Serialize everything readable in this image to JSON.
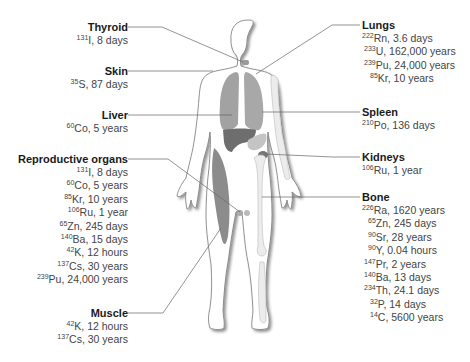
{
  "figure": {
    "colors": {
      "organ_dark": "#6e6e6e",
      "organ_mid": "#9a9a9a",
      "organ_light": "#c4c4c4",
      "bone": "#eeeeee",
      "outline": "#777777",
      "leader": "#666666",
      "title_text": "#1a1a1a",
      "item_text": "#444444"
    }
  },
  "left_labels": [
    {
      "name": "Thyroid",
      "items": [
        {
          "mass": "131",
          "text": "I, 8 days"
        }
      ]
    },
    {
      "name": "Skin",
      "items": [
        {
          "mass": "35",
          "text": "S, 87 days"
        }
      ]
    },
    {
      "name": "Liver",
      "items": [
        {
          "mass": "60",
          "text": "Co, 5 years"
        }
      ]
    },
    {
      "name": "Reproductive organs",
      "items": [
        {
          "mass": "131",
          "text": "I, 8 days"
        },
        {
          "mass": "60",
          "text": "Co, 5 years"
        },
        {
          "mass": "85",
          "text": "Kr, 10 years"
        },
        {
          "mass": "106",
          "text": "Ru, 1 year"
        },
        {
          "mass": "65",
          "text": "Zn, 245 days"
        },
        {
          "mass": "140",
          "text": "Ba, 15 days"
        },
        {
          "mass": "42",
          "text": "K, 12 hours"
        },
        {
          "mass": "137",
          "text": "Cs, 30 years"
        },
        {
          "mass": "239",
          "text": "Pu, 24,000 years"
        }
      ]
    },
    {
      "name": "Muscle",
      "items": [
        {
          "mass": "42",
          "text": "K, 12 hours"
        },
        {
          "mass": "137",
          "text": "Cs, 30 years"
        }
      ]
    }
  ],
  "right_labels": [
    {
      "name": "Lungs",
      "items": [
        {
          "mass": "222",
          "text": "Rn, 3.6 days"
        },
        {
          "mass": "233",
          "text": "U, 162,000 years"
        },
        {
          "mass": "239",
          "text": "Pu, 24,000 years"
        },
        {
          "mass": "85",
          "text": "Kr, 10 years"
        }
      ]
    },
    {
      "name": "Spleen",
      "items": [
        {
          "mass": "210",
          "text": "Po, 136 days"
        }
      ]
    },
    {
      "name": "Kidneys",
      "items": [
        {
          "mass": "106",
          "text": "Ru, 1 year"
        }
      ]
    },
    {
      "name": "Bone",
      "items": [
        {
          "mass": "226",
          "text": "Ra, 1620 years"
        },
        {
          "mass": "65",
          "text": "Zn, 245 days"
        },
        {
          "mass": "90",
          "text": "Sr, 28 years"
        },
        {
          "mass": "90",
          "text": "Y, 0.04 hours"
        },
        {
          "mass": "147",
          "text": "Pr, 2 years"
        },
        {
          "mass": "140",
          "text": "Ba, 13 days"
        },
        {
          "mass": "234",
          "text": "Th, 24.1 days"
        },
        {
          "mass": "32",
          "text": "P, 14 days"
        },
        {
          "mass": "14",
          "text": "C, 5600 years"
        }
      ]
    }
  ]
}
